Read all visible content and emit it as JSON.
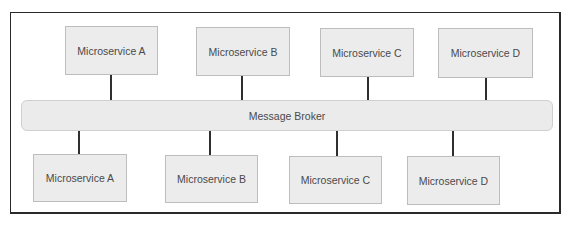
{
  "diagram": {
    "title": "",
    "broker": {
      "label": "Message Broker"
    },
    "top_services": [
      {
        "label": "Microservice A"
      },
      {
        "label": "Microservice B"
      },
      {
        "label": "Microservice C"
      },
      {
        "label": "Microservice D"
      }
    ],
    "bottom_services": [
      {
        "label": "Microservice A"
      },
      {
        "label": "Microservice B"
      },
      {
        "label": "Microservice C"
      },
      {
        "label": "Microservice D"
      }
    ],
    "edges": [
      {
        "from": "top_services.0",
        "to": "broker"
      },
      {
        "from": "top_services.1",
        "to": "broker"
      },
      {
        "from": "top_services.2",
        "to": "broker"
      },
      {
        "from": "top_services.3",
        "to": "broker"
      },
      {
        "from": "broker",
        "to": "bottom_services.0"
      },
      {
        "from": "broker",
        "to": "bottom_services.1"
      },
      {
        "from": "broker",
        "to": "bottom_services.2"
      },
      {
        "from": "broker",
        "to": "bottom_services.3"
      }
    ],
    "colors": {
      "box_fill": "#ececec",
      "box_border": "#bdbdbd",
      "broker_fill": "#ebebeb",
      "connector": "#2f2f2f",
      "frame": "#2a2a2a",
      "text": "#4a4a4a"
    }
  }
}
